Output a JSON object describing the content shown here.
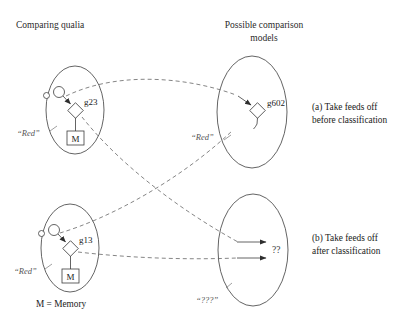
{
  "figure": {
    "headers": {
      "left": "Comparing qualia",
      "right_line1": "Possible comparison",
      "right_line2": "models"
    },
    "legend": "M = Memory",
    "captions": {
      "a_line1": "(a) Take feeds off",
      "a_line2": "before classification",
      "b_line1": "(b) Take feeds off",
      "b_line2": "after classification"
    },
    "rows": [
      {
        "id": "row-a",
        "source_ellipse": {
          "qualia_label": "“Red”",
          "node_label": "g23",
          "memory_label": "M"
        },
        "target_ellipse": {
          "qualia_label": "“Red”",
          "node_label": "g602"
        }
      },
      {
        "id": "row-b",
        "source_ellipse": {
          "qualia_label": "“Red”",
          "node_label": "g13",
          "memory_label": "M"
        },
        "target_ellipse": {
          "qualia_label": "“???”",
          "node_label": "??"
        }
      }
    ],
    "colors": {
      "stroke": "#3c3c3c",
      "dashed": "#666666",
      "text": "#1a1a1a",
      "muted": "#555555",
      "background": "#ffffff"
    }
  }
}
